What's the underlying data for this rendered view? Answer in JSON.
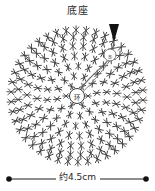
{
  "diagram": {
    "title": "底座",
    "type": "crochet-round-chart",
    "center_ring_label": "环",
    "round_marker_label": "⑤",
    "stitch_symbol_name": "single-crochet-x",
    "start_arrow_name": "direction-arrow",
    "colors": {
      "stitch": "#3a3a3a",
      "guide": "#6b6b6b",
      "text": "#262626",
      "background": "#ffffff"
    },
    "rounds": [
      {
        "index": 1,
        "radius": 11,
        "stitches": 6
      },
      {
        "index": 2,
        "radius": 20,
        "stitches": 12
      },
      {
        "index": 3,
        "radius": 30,
        "stitches": 18
      },
      {
        "index": 4,
        "radius": 40,
        "stitches": 24
      },
      {
        "index": 5,
        "radius": 50,
        "stitches": 30
      },
      {
        "index": 6,
        "radius": 59,
        "stitches": 36
      },
      {
        "index": 7,
        "radius": 66,
        "stitches": 42
      }
    ]
  },
  "dimension": {
    "label": "约4.5cm",
    "value": 4.5,
    "unit": "cm",
    "approximate": true,
    "orientation": "horizontal"
  }
}
